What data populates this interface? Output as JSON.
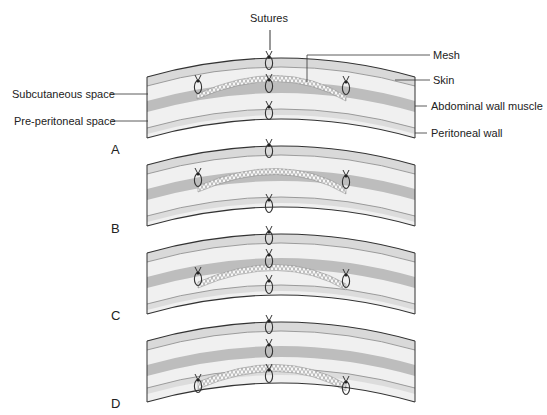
{
  "diagram": {
    "title_label": "Sutures",
    "left_labels": [
      {
        "id": "subcutaneous",
        "text": "Subcutaneous space"
      },
      {
        "id": "preperitoneal",
        "text": "Pre-peritoneal space"
      }
    ],
    "right_labels": [
      {
        "id": "mesh",
        "text": "Mesh"
      },
      {
        "id": "skin",
        "text": "Skin"
      },
      {
        "id": "muscle",
        "text": "Abdominal wall muscle"
      },
      {
        "id": "peritoneum",
        "text": "Peritoneal wall"
      }
    ],
    "panels": [
      {
        "letter": "A",
        "mesh_position": "subcutaneous (onlay, above muscle)"
      },
      {
        "letter": "B",
        "mesh_position": "inlay (bridging muscle gap)"
      },
      {
        "letter": "C",
        "mesh_position": "sublay (under muscle, pre-peritoneal)"
      },
      {
        "letter": "D",
        "mesh_position": "intraperitoneal (below peritoneum)"
      }
    ],
    "colors": {
      "skin_band": "#d9d9d9",
      "space": "#f0f0f0",
      "muscle": "#bdbdbd",
      "peritoneum": "#dcdcdc",
      "outline": "#333333",
      "mesh": "#f5f5f5"
    }
  }
}
